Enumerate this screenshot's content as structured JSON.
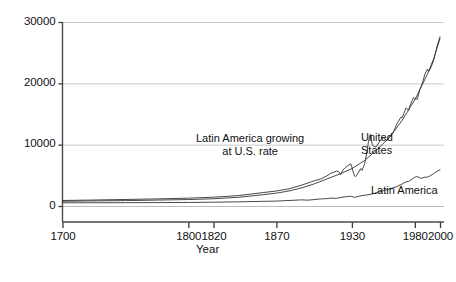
{
  "chart_data": {
    "type": "line",
    "title": "",
    "xlabel": "Year",
    "ylabel": "GDP per Capita",
    "xlim": [
      1700,
      2000
    ],
    "ylim": [
      0,
      30000
    ],
    "grid": "horizontal",
    "legend_position": "inline-annotations",
    "xticks": [
      {
        "value": 1700,
        "label": "1700"
      },
      {
        "value": 1800,
        "label": "1800"
      },
      {
        "value": 1820,
        "label": "1820"
      },
      {
        "value": 1870,
        "label": "1870"
      },
      {
        "value": 1930,
        "label": "1930"
      },
      {
        "value": 1980,
        "label": "1980"
      },
      {
        "value": 2000,
        "label": "2000"
      }
    ],
    "yticks": [
      {
        "value": 0,
        "label": "0"
      },
      {
        "value": 10000,
        "label": "10000"
      },
      {
        "value": 20000,
        "label": "20000"
      },
      {
        "value": 30000,
        "label": "30000"
      }
    ],
    "series": [
      {
        "name": "United States",
        "annotation": "United\nStates",
        "color": "#333333",
        "x": [
          1700,
          1720,
          1740,
          1760,
          1780,
          1800,
          1820,
          1840,
          1860,
          1870,
          1880,
          1890,
          1900,
          1905,
          1910,
          1913,
          1918,
          1920,
          1921,
          1923,
          1925,
          1929,
          1930,
          1932,
          1933,
          1935,
          1937,
          1938,
          1940,
          1942,
          1943,
          1944,
          1945,
          1946,
          1947,
          1949,
          1950,
          1953,
          1955,
          1958,
          1960,
          1963,
          1966,
          1969,
          1970,
          1973,
          1975,
          1976,
          1979,
          1980,
          1982,
          1984,
          1986,
          1988,
          1990,
          1991,
          1993,
          1995,
          1997,
          1999,
          2000
        ],
        "values": [
          900,
          960,
          1030,
          1100,
          1180,
          1280,
          1430,
          1700,
          2200,
          2450,
          2800,
          3400,
          4100,
          4400,
          4900,
          5300,
          5700,
          5500,
          5100,
          5900,
          6300,
          6900,
          6300,
          4900,
          4800,
          5400,
          6100,
          5800,
          6800,
          8800,
          10300,
          11300,
          11700,
          10100,
          9800,
          9600,
          9900,
          10800,
          11100,
          10700,
          11300,
          12100,
          13500,
          14500,
          14400,
          16000,
          15600,
          16300,
          17700,
          17500,
          17400,
          19000,
          20000,
          21500,
          22300,
          21900,
          22700,
          23800,
          25500,
          27000,
          27600
        ]
      },
      {
        "name": "Latin America growing at U.S. rate",
        "annotation": "Latin America growing\nat U.S. rate",
        "color": "#333333",
        "note": "Counterfactual: Latin America's 1700 level compounded at the U.S. growth rate",
        "x": [
          1700,
          1750,
          1800,
          1820,
          1840,
          1860,
          1870,
          1880,
          1890,
          1900,
          1910,
          1920,
          1930,
          1940,
          1950,
          1960,
          1970,
          1980,
          1990,
          1995,
          2000
        ],
        "values": [
          780,
          880,
          1050,
          1180,
          1420,
          1850,
          2100,
          2450,
          2950,
          3600,
          4400,
          5200,
          6100,
          7400,
          9200,
          11200,
          14000,
          17300,
          21500,
          24000,
          27300
        ]
      },
      {
        "name": "Latin America",
        "annotation": "Latin America",
        "color": "#333333",
        "x": [
          1700,
          1750,
          1800,
          1820,
          1840,
          1860,
          1870,
          1880,
          1890,
          1895,
          1900,
          1905,
          1910,
          1913,
          1918,
          1920,
          1925,
          1929,
          1930,
          1932,
          1935,
          1938,
          1940,
          1945,
          1950,
          1955,
          1960,
          1965,
          1970,
          1973,
          1975,
          1980,
          1982,
          1985,
          1988,
          1990,
          1992,
          1995,
          1998,
          2000
        ],
        "values": [
          520,
          540,
          580,
          620,
          680,
          760,
          800,
          900,
          1000,
          950,
          1050,
          1150,
          1200,
          1280,
          1250,
          1350,
          1500,
          1600,
          1550,
          1400,
          1550,
          1700,
          1750,
          1900,
          2200,
          2500,
          2800,
          3100,
          3600,
          3950,
          4000,
          4700,
          4800,
          4500,
          4700,
          4700,
          4900,
          5300,
          5700,
          5900
        ]
      }
    ]
  }
}
